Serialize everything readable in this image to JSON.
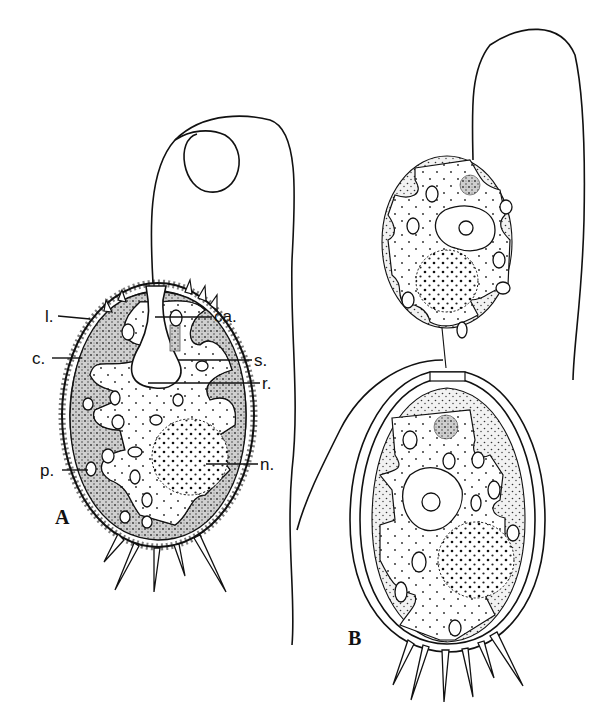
{
  "figure": {
    "panels": [
      {
        "id": "A",
        "label": "A",
        "annotations": [
          {
            "key": "l",
            "text": "l."
          },
          {
            "key": "ca",
            "text": "ca."
          },
          {
            "key": "c",
            "text": "c."
          },
          {
            "key": "s",
            "text": "s."
          },
          {
            "key": "r",
            "text": "r."
          },
          {
            "key": "p",
            "text": "p."
          },
          {
            "key": "n",
            "text": "n."
          }
        ]
      },
      {
        "id": "B",
        "label": "B",
        "annotations": []
      }
    ],
    "colors": {
      "ink": "#111111",
      "background": "#ffffff"
    }
  }
}
